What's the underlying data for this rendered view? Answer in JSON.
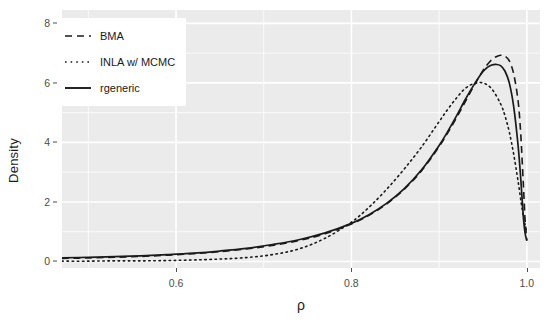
{
  "chart_data": {
    "type": "line",
    "title": "",
    "subtitle": "",
    "xlabel": "ρ",
    "ylabel": "Density",
    "xlim": [
      0.47,
      1.015
    ],
    "ylim": [
      -0.22,
      8.45
    ],
    "xticks": [
      0.6,
      0.8,
      1.0
    ],
    "xtick_labels": [
      "0.6",
      "0.8",
      "1.0"
    ],
    "yticks": [
      0,
      2,
      4,
      6,
      8
    ],
    "ytick_labels": [
      "0",
      "2",
      "4",
      "6",
      "8"
    ],
    "grid": true,
    "grid_color": "#ffffff",
    "panel_background": "#ebebeb",
    "legend_position": "top-left",
    "legend_background": "#ffffff",
    "series": [
      {
        "name": "BMA",
        "linestyle": "dashed",
        "color": "#1a1a1a",
        "x": [
          0.47,
          0.5,
          0.53,
          0.56,
          0.59,
          0.62,
          0.65,
          0.68,
          0.71,
          0.74,
          0.77,
          0.8,
          0.82,
          0.84,
          0.86,
          0.88,
          0.9,
          0.91,
          0.92,
          0.93,
          0.94,
          0.95,
          0.955,
          0.96,
          0.965,
          0.97,
          0.975,
          0.98,
          0.985,
          0.99,
          0.993,
          0.996,
          0.998,
          1.0
        ],
        "y": [
          0.1,
          0.12,
          0.14,
          0.17,
          0.21,
          0.26,
          0.33,
          0.42,
          0.54,
          0.7,
          0.93,
          1.26,
          1.55,
          1.93,
          2.42,
          3.05,
          3.86,
          4.33,
          4.84,
          5.38,
          5.92,
          6.42,
          6.62,
          6.78,
          6.88,
          6.93,
          6.9,
          6.74,
          6.3,
          5.4,
          4.3,
          2.6,
          1.4,
          0.7
        ]
      },
      {
        "name": "INLA w/ MCMC",
        "linestyle": "dotted",
        "color": "#1a1a1a",
        "x": [
          0.47,
          0.5,
          0.53,
          0.56,
          0.59,
          0.62,
          0.65,
          0.68,
          0.71,
          0.74,
          0.77,
          0.8,
          0.82,
          0.84,
          0.86,
          0.88,
          0.9,
          0.91,
          0.92,
          0.93,
          0.94,
          0.95,
          0.96,
          0.97,
          0.975,
          0.98,
          0.985,
          0.99,
          0.995,
          1.0
        ],
        "y": [
          0.01,
          0.01,
          0.02,
          0.02,
          0.03,
          0.05,
          0.08,
          0.13,
          0.23,
          0.42,
          0.78,
          1.32,
          1.82,
          2.42,
          3.1,
          3.85,
          4.7,
          5.12,
          5.5,
          5.82,
          5.98,
          6.0,
          5.8,
          5.3,
          4.9,
          4.35,
          3.6,
          2.7,
          1.7,
          0.95
        ]
      },
      {
        "name": "rgeneric",
        "linestyle": "solid",
        "color": "#1a1a1a",
        "x": [
          0.47,
          0.5,
          0.53,
          0.56,
          0.59,
          0.62,
          0.65,
          0.68,
          0.71,
          0.74,
          0.77,
          0.8,
          0.82,
          0.84,
          0.86,
          0.88,
          0.9,
          0.91,
          0.92,
          0.93,
          0.94,
          0.95,
          0.955,
          0.96,
          0.965,
          0.97,
          0.975,
          0.98,
          0.985,
          0.99,
          0.993,
          0.996,
          0.998,
          1.0
        ],
        "y": [
          0.12,
          0.14,
          0.16,
          0.19,
          0.23,
          0.28,
          0.35,
          0.44,
          0.57,
          0.73,
          0.96,
          1.28,
          1.57,
          1.95,
          2.44,
          3.08,
          3.9,
          4.38,
          4.9,
          5.45,
          5.95,
          6.38,
          6.52,
          6.6,
          6.62,
          6.58,
          6.4,
          6.0,
          5.2,
          3.9,
          2.8,
          1.5,
          0.95,
          0.7
        ]
      }
    ]
  },
  "axes": {
    "y_title": "Density",
    "x_title": "ρ"
  },
  "legend": {
    "items": [
      {
        "label": "BMA",
        "style": "dashed"
      },
      {
        "label": "INLA w/ MCMC",
        "style": "dotted"
      },
      {
        "label": "rgeneric",
        "style": "solid"
      }
    ]
  }
}
